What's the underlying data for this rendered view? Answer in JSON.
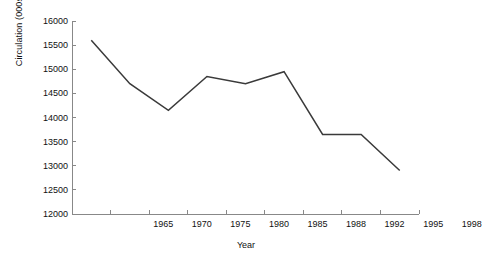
{
  "chart_data": {
    "type": "line",
    "title": "",
    "subtitle": "",
    "xlabel": "Year",
    "ylabel": "Circulation (000s)",
    "categories": [
      "1965",
      "1970",
      "1975",
      "1980",
      "1985",
      "1988",
      "1992",
      "1995",
      "1998"
    ],
    "series": [
      {
        "name": "Circulation",
        "values": [
          15600,
          14700,
          14150,
          14850,
          14700,
          14950,
          13650,
          13650,
          12900
        ],
        "color": "#3a3a3a"
      }
    ],
    "ylim": [
      12000,
      16000
    ],
    "ytick_labels": [
      "16000",
      "15500",
      "15000",
      "14500",
      "14000",
      "13500",
      "13000",
      "12500",
      "12000"
    ],
    "ytick_values": [
      16000,
      15500,
      15000,
      14500,
      14000,
      13500,
      13000,
      12500,
      12000
    ],
    "ytick_step": 500,
    "grid": false,
    "legend": "none",
    "axis_color": "#888888",
    "background": "#ffffff"
  }
}
